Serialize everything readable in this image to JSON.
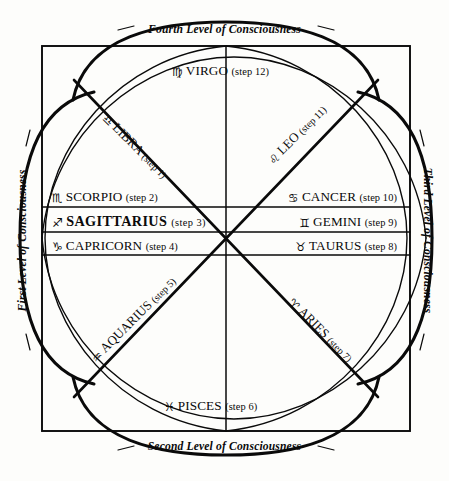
{
  "diagram": {
    "ink_color": "#0a0a0a",
    "paper_color": "#fdfdfb"
  },
  "levels": {
    "top": "Fourth Level of Consciousness",
    "bottom": "Second Level of Consciousness",
    "left": "First Level of Consciousness",
    "right": "Third Level of Consciousness"
  },
  "signs": [
    {
      "key": "virgo",
      "glyph": "♍",
      "name": "VIRGO",
      "step": "(step 12)",
      "step_number": 12,
      "position": "top-center",
      "emphasis": "normal"
    },
    {
      "key": "libra",
      "glyph": "♎",
      "name": "LIBRA",
      "step": "(step 1)",
      "step_number": 1,
      "position": "upper-left-diagonal",
      "emphasis": "normal"
    },
    {
      "key": "leo",
      "glyph": "♌",
      "name": "LEO",
      "step": "(step 11)",
      "step_number": 11,
      "position": "upper-right-diagonal",
      "emphasis": "normal"
    },
    {
      "key": "scorpio",
      "glyph": "♏",
      "name": "SCORPIO",
      "step": "(step 2)",
      "step_number": 2,
      "position": "left-row-1",
      "emphasis": "normal"
    },
    {
      "key": "cancer",
      "glyph": "♋",
      "name": "CANCER",
      "step": "(step 10)",
      "step_number": 10,
      "position": "right-row-1",
      "emphasis": "normal"
    },
    {
      "key": "sagittarius",
      "glyph": "♐",
      "name": "SAGITTARIUS",
      "step": "(step 3)",
      "step_number": 3,
      "position": "left-row-2",
      "emphasis": "bold"
    },
    {
      "key": "gemini",
      "glyph": "♊",
      "name": "GEMINI",
      "step": "(step 9)",
      "step_number": 9,
      "position": "right-row-2",
      "emphasis": "normal"
    },
    {
      "key": "capricorn",
      "glyph": "♑",
      "name": "CAPRICORN",
      "step": "(step 4)",
      "step_number": 4,
      "position": "left-row-3",
      "emphasis": "normal"
    },
    {
      "key": "taurus",
      "glyph": "♉",
      "name": "TAURUS",
      "step": "(step 8)",
      "step_number": 8,
      "position": "right-row-3",
      "emphasis": "normal"
    },
    {
      "key": "aquarius",
      "glyph": "♒",
      "name": "AQUARIUS",
      "step": "(step 5)",
      "step_number": 5,
      "position": "lower-left-diagonal",
      "emphasis": "normal"
    },
    {
      "key": "aries",
      "glyph": "♈",
      "name": "ARIES",
      "step": "(step 7)",
      "step_number": 7,
      "position": "lower-right-diagonal",
      "emphasis": "normal"
    },
    {
      "key": "pisces",
      "glyph": "♓",
      "name": "PISCES",
      "step": "(step 6)",
      "step_number": 6,
      "position": "bottom-center",
      "emphasis": "normal"
    }
  ]
}
